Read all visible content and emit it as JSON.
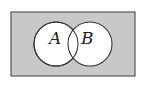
{
  "diagram": {
    "type": "venn",
    "universe": {
      "x": 11,
      "y": 12,
      "width": 124,
      "height": 64,
      "fill": "#c8c8c8",
      "stroke": "#555555"
    },
    "sets": [
      {
        "label": "A",
        "cx": 56,
        "cy": 44,
        "r": 22,
        "fill": "#ffffff",
        "stroke": "#333333"
      },
      {
        "label": "B",
        "cx": 90,
        "cy": 44,
        "r": 22,
        "fill": "#ffffff",
        "stroke": "#333333"
      }
    ]
  }
}
